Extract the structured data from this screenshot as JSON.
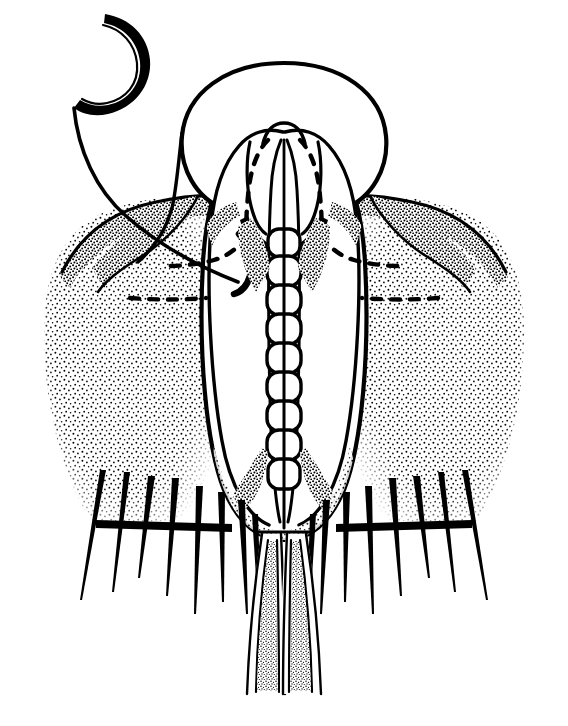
{
  "figure": {
    "title": "Male terminalia, ventral view",
    "domain_kind": "scientific-line-drawing",
    "background_color": "#ffffff",
    "ink_color": "#000000",
    "canvas": {
      "width": 568,
      "height": 726
    },
    "caption": "",
    "labels": []
  },
  "structures": {
    "hook": {
      "name": "apical hook",
      "note": "crescent / sickle shaped sclerite at upper left"
    },
    "filament": {
      "name": "filament",
      "note": "long sweeping line from hook down into body"
    },
    "hood": {
      "name": "dorsal hood",
      "note": "broad elliptical arch across the top"
    },
    "capsule": {
      "name": "genital capsule",
      "note": "large vertical oval outline enclosing the lobes"
    },
    "lobes": {
      "name": "paired parameres",
      "count": 2,
      "note": "mirror-image inner lobes with dashed internal outlines"
    },
    "aedeagus": {
      "name": "segmented aedeagus",
      "segment_count": 9,
      "note": "ladder-like central rod, each unit split by a median line"
    },
    "comma": {
      "name": "comma sclerite",
      "note": "small thick hook inside the left lobe"
    },
    "body": {
      "name": "stippled abdominal segment",
      "shading": "stipple",
      "note": "broad shoulders left and right, dark upper margin"
    },
    "setae": {
      "name": "marginal setae",
      "left_count": 8,
      "right_count": 8,
      "note": "tapering bristles emerging from sockets along the dark lower rim"
    },
    "cerci": {
      "name": "paired cerci",
      "count": 2,
      "note": "two long tubular processes descending below, stipple filled"
    }
  },
  "colors": {
    "ink": "#000000",
    "paper": "#ffffff",
    "stipple": "#111111"
  }
}
